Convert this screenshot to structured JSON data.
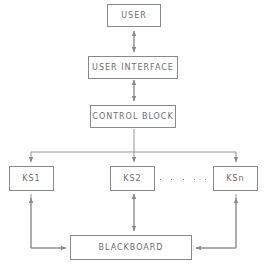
{
  "diagram": {
    "colors": {
      "stroke": "#8a8a8a",
      "text": "#6e6e6e",
      "background": "#ffffff"
    },
    "nodes": [
      {
        "id": "user",
        "label": "USER",
        "x": 107,
        "y": 4,
        "w": 54,
        "h": 23
      },
      {
        "id": "ui",
        "label": "USER INTERFACE",
        "x": 88,
        "y": 56,
        "w": 90,
        "h": 23
      },
      {
        "id": "control",
        "label": "CONTROL BLOCK",
        "x": 90,
        "y": 105,
        "w": 86,
        "h": 23
      },
      {
        "id": "ks1",
        "label": "KS1",
        "x": 9,
        "y": 166,
        "w": 45,
        "h": 25
      },
      {
        "id": "ks2",
        "label": "KS2",
        "x": 110,
        "y": 166,
        "w": 45,
        "h": 25
      },
      {
        "id": "ksn",
        "label": "KSn",
        "x": 213,
        "y": 166,
        "w": 45,
        "h": 25
      },
      {
        "id": "blackboard",
        "label": "BLACKBOARD",
        "x": 70,
        "y": 235,
        "w": 122,
        "h": 25
      }
    ],
    "ellipsis": {
      "label": ". . . . .",
      "count": 5,
      "x": 160,
      "y": 178,
      "w": 46
    },
    "edges": [
      {
        "id": "user-ui",
        "from": "user",
        "to": "ui",
        "kind": "bidirectional",
        "label": ""
      },
      {
        "id": "ui-control",
        "from": "ui",
        "to": "control",
        "kind": "bidirectional",
        "label": ""
      },
      {
        "id": "control-bus",
        "from": "control",
        "to": "ks-bus",
        "kind": "bus",
        "label": ""
      },
      {
        "id": "bus-ks1",
        "from": "ks-bus",
        "to": "ks1",
        "kind": "directed",
        "label": ""
      },
      {
        "id": "bus-ks2",
        "from": "ks-bus",
        "to": "ks2",
        "kind": "directed",
        "label": ""
      },
      {
        "id": "bus-ksn",
        "from": "ks-bus",
        "to": "ksn",
        "kind": "directed",
        "label": ""
      },
      {
        "id": "bb-ks1",
        "from": "blackboard",
        "to": "ks1",
        "kind": "directed",
        "label": ""
      },
      {
        "id": "ks2-bb",
        "from": "ks2",
        "to": "blackboard",
        "kind": "bidirectional",
        "label": ""
      },
      {
        "id": "ksn-bb",
        "from": "ksn",
        "to": "blackboard",
        "kind": "directed",
        "label": ""
      }
    ]
  }
}
